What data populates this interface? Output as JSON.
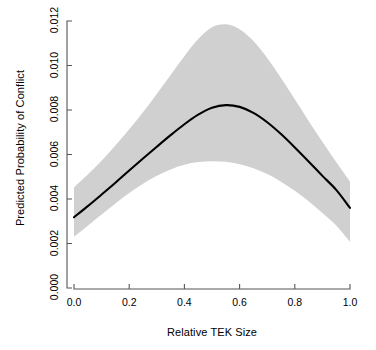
{
  "chart_data": {
    "type": "line",
    "title": "",
    "xlabel": "Relative TEK Size",
    "ylabel": "Predicted Probability of Conflict",
    "xlim": [
      0.0,
      1.0
    ],
    "ylim": [
      0.0,
      0.012
    ],
    "grid": false,
    "legend": null,
    "xticks": [
      "0.0",
      "0.2",
      "0.4",
      "0.6",
      "0.8",
      "1.0"
    ],
    "xtick_values": [
      0.0,
      0.2,
      0.4,
      0.6,
      0.8,
      1.0
    ],
    "yticks": [
      "0.000",
      "0.002",
      "0.004",
      "0.006",
      "0.008",
      "0.010",
      "0.012"
    ],
    "ytick_values": [
      0.0,
      0.002,
      0.004,
      0.006,
      0.008,
      0.01,
      0.012
    ],
    "line_color": "#000000",
    "band_color": "#d0d0d0",
    "axis_color": "#555555",
    "x": [
      0.0,
      0.05,
      0.1,
      0.15,
      0.2,
      0.25,
      0.3,
      0.35,
      0.4,
      0.45,
      0.5,
      0.55,
      0.6,
      0.65,
      0.7,
      0.75,
      0.8,
      0.85,
      0.9,
      0.95,
      1.0
    ],
    "series": [
      {
        "name": "Predicted probability",
        "values": [
          0.00318,
          0.00368,
          0.0042,
          0.00473,
          0.00528,
          0.00582,
          0.00635,
          0.00687,
          0.00736,
          0.00779,
          0.0081,
          0.00822,
          0.00814,
          0.00787,
          0.00745,
          0.00692,
          0.00632,
          0.00569,
          0.00504,
          0.00441,
          0.0036
        ]
      },
      {
        "name": "Confidence interval lower",
        "values": [
          0.0023,
          0.0028,
          0.0033,
          0.0038,
          0.00427,
          0.00468,
          0.00504,
          0.00533,
          0.00554,
          0.00566,
          0.0057,
          0.00567,
          0.00556,
          0.00538,
          0.00512,
          0.00478,
          0.00437,
          0.0039,
          0.00337,
          0.00281,
          0.00208
        ]
      },
      {
        "name": "Confidence interval upper",
        "values": [
          0.00452,
          0.0051,
          0.00572,
          0.0064,
          0.00713,
          0.0079,
          0.00872,
          0.00957,
          0.01042,
          0.01119,
          0.01172,
          0.01185,
          0.01163,
          0.0111,
          0.01034,
          0.00944,
          0.00848,
          0.00751,
          0.00657,
          0.00566,
          0.00478
        ]
      }
    ]
  }
}
